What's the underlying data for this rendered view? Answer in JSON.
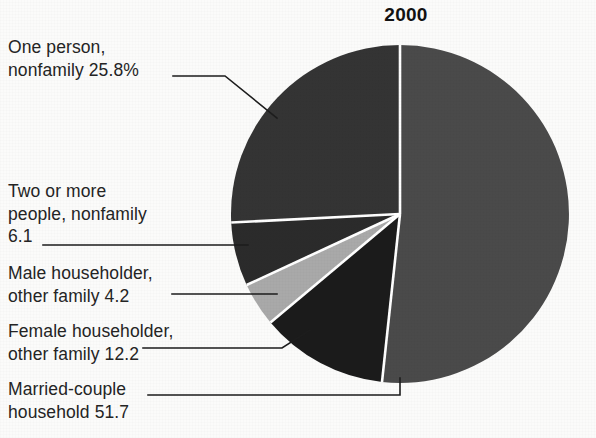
{
  "chart_data": {
    "type": "pie",
    "title": "2000",
    "unit": "percent",
    "start_angle_deg": 0,
    "direction": "clockwise",
    "categories": [
      "Married-couple household",
      "Female householder, other family",
      "Male householder, other family",
      "Two or more people, nonfamily",
      "One person, nonfamily"
    ],
    "values": [
      51.7,
      12.2,
      4.2,
      6.1,
      25.8
    ],
    "xlabel": "",
    "ylabel": "",
    "legend_position": "callout-labels-left",
    "grid": false,
    "slices": [
      {
        "name": "married-couple-household",
        "label_line1": "Married-couple",
        "label_line2": "household  51.7",
        "value": 51.7,
        "value_text": "51.7",
        "color": "#4a4a4a",
        "start_deg": 0,
        "end_deg": 186.12
      },
      {
        "name": "female-householder-other-family",
        "label_line1": "Female householder,",
        "label_line2": "other family  12.2",
        "value": 12.2,
        "value_text": "12.2",
        "color": "#1b1b1b",
        "start_deg": 186.12,
        "end_deg": 230.04
      },
      {
        "name": "male-householder-other-family",
        "label_line1": "Male householder,",
        "label_line2": "other family  4.2",
        "value": 4.2,
        "value_text": "4.2",
        "color": "#a9a9a9",
        "start_deg": 230.04,
        "end_deg": 245.16
      },
      {
        "name": "two-or-more-people-nonfamily",
        "label_line1": "Two or more",
        "label_line2": "people, nonfamily",
        "label_line3": "6.1",
        "value": 6.1,
        "value_text": "6.1",
        "color": "#2b2b2b",
        "start_deg": 245.16,
        "end_deg": 267.12
      },
      {
        "name": "one-person-nonfamily",
        "label_line1": "One person,",
        "label_line2": "nonfamily  25.8%",
        "value": 25.8,
        "value_text": "25.8%",
        "color": "#343434",
        "start_deg": 267.12,
        "end_deg": 360
      }
    ]
  },
  "labels": {
    "one_person": {
      "line1": "One person,",
      "line2": "nonfamily  25.8%"
    },
    "two_or_more": {
      "line1": "Two or more",
      "line2": "people, nonfamily",
      "line3": "6.1"
    },
    "male_householder": {
      "line1": "Male householder,",
      "line2": "other family  4.2"
    },
    "female_householder": {
      "line1": "Female householder,",
      "line2": "other family  12.2"
    },
    "married_couple": {
      "line1": "Married-couple",
      "line2": "household  51.7"
    }
  },
  "colors": {
    "background": "#fbfbfa",
    "text": "#242424",
    "title": "#121212",
    "leader_line": "#1d1d1d",
    "slice_divider": "#ffffff",
    "slice_married": "#4a4a4a",
    "slice_female": "#1b1b1b",
    "slice_male": "#a9a9a9",
    "slice_two_or_more": "#2b2b2b",
    "slice_one_person": "#343434"
  }
}
